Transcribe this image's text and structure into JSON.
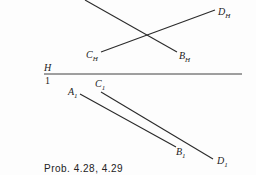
{
  "diagram": {
    "type": "descriptive-geometry-projection",
    "stroke_color": "#2a2a2a",
    "folding_line": {
      "upper_label": "H",
      "lower_label": "1"
    },
    "horizontal_view": {
      "lines": [
        {
          "from_label": "",
          "to_label": "B",
          "to_sub": "H"
        },
        {
          "from_label": "C",
          "from_sub": "H",
          "to_label": "D",
          "to_sub": "H"
        }
      ],
      "labels": {
        "D": {
          "main": "D",
          "sub": "H"
        },
        "C": {
          "main": "C",
          "sub": "H"
        },
        "B": {
          "main": "B",
          "sub": "H"
        }
      }
    },
    "auxiliary_view": {
      "labels": {
        "A": {
          "main": "A",
          "sub": "1"
        },
        "C": {
          "main": "C",
          "sub": "1"
        },
        "B": {
          "main": "B",
          "sub": "1"
        },
        "D": {
          "main": "D",
          "sub": "1"
        }
      }
    },
    "caption": "Prob. 4.28, 4.29"
  }
}
